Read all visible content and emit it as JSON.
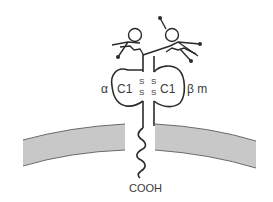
{
  "diagram": {
    "title": "",
    "labels": {
      "alpha_chain": "α",
      "left_domain": "C1",
      "right_domain": "C1",
      "beta_chain": "β m",
      "disulfide_s": "S",
      "terminus": "COOH"
    },
    "colors": {
      "stroke": "#2b2b2b",
      "membrane_fill": "#c8c8c8",
      "membrane_edge": "#6a6a6a",
      "background": "#ffffff"
    },
    "components": [
      "glycan-left",
      "glycan-right",
      "alpha-chain",
      "beta-chain",
      "c1-domain-left",
      "c1-domain-right",
      "disulfide-bonds",
      "cell-membrane",
      "cytoplasmic-tail"
    ]
  }
}
